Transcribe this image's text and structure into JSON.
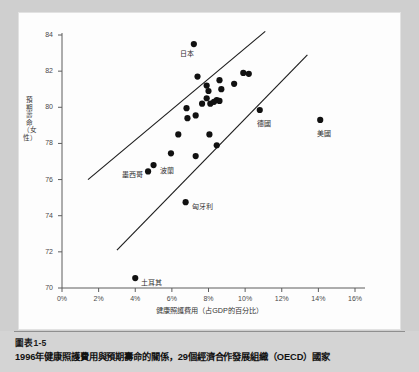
{
  "figure": {
    "caption_number": "圖表1-5",
    "caption_title": "1996年健康照護費用與預期壽命的關係，29個經濟合作發展組織（OECD）國家"
  },
  "chart_data": {
    "type": "scatter",
    "title": "",
    "xlabel": "健康照護費用（占GDP的百分比）",
    "ylabel": "預期壽命（女性）",
    "xlim": [
      0,
      16
    ],
    "ylim": [
      70,
      84
    ],
    "grid": false,
    "legend": "none",
    "xticks": [
      "0%",
      "2%",
      "4%",
      "6%",
      "8%",
      "10%",
      "12%",
      "14%",
      "16%"
    ],
    "xtick_values": [
      0,
      2,
      4,
      6,
      8,
      10,
      12,
      14,
      16
    ],
    "yticks": [
      "70",
      "72",
      "74",
      "76",
      "78",
      "80",
      "82",
      "84"
    ],
    "ytick_values": [
      70,
      72,
      74,
      76,
      78,
      80,
      82,
      84
    ],
    "marker": {
      "shape": "circle",
      "color": "#111111",
      "size": 3.1
    },
    "points": [
      {
        "x": 7.2,
        "y": 83.5,
        "label": "日本",
        "label_dx": -14,
        "label_dy": 8
      },
      {
        "x": 7.4,
        "y": 81.7,
        "label": ""
      },
      {
        "x": 7.9,
        "y": 81.2,
        "label": ""
      },
      {
        "x": 8.0,
        "y": 80.9,
        "label": ""
      },
      {
        "x": 8.6,
        "y": 81.5,
        "label": ""
      },
      {
        "x": 9.4,
        "y": 81.3,
        "label": ""
      },
      {
        "x": 9.9,
        "y": 81.9,
        "label": ""
      },
      {
        "x": 10.2,
        "y": 81.85,
        "label": ""
      },
      {
        "x": 8.7,
        "y": 81.0,
        "label": ""
      },
      {
        "x": 7.9,
        "y": 80.5,
        "label": ""
      },
      {
        "x": 8.1,
        "y": 80.2,
        "label": ""
      },
      {
        "x": 8.45,
        "y": 80.4,
        "label": ""
      },
      {
        "x": 8.6,
        "y": 80.35,
        "label": ""
      },
      {
        "x": 7.65,
        "y": 80.2,
        "label": ""
      },
      {
        "x": 6.8,
        "y": 79.95,
        "label": ""
      },
      {
        "x": 6.85,
        "y": 79.4,
        "label": ""
      },
      {
        "x": 7.3,
        "y": 79.55,
        "label": ""
      },
      {
        "x": 10.8,
        "y": 79.85,
        "label": "德國",
        "label_dx": -3,
        "label_dy": 12
      },
      {
        "x": 14.1,
        "y": 79.3,
        "label": "美國",
        "label_dx": -3,
        "label_dy": 12
      },
      {
        "x": 6.35,
        "y": 78.5,
        "label": ""
      },
      {
        "x": 8.05,
        "y": 78.5,
        "label": ""
      },
      {
        "x": 8.45,
        "y": 77.9,
        "label": ""
      },
      {
        "x": 5.95,
        "y": 77.45,
        "label": ""
      },
      {
        "x": 7.3,
        "y": 77.3,
        "label": ""
      },
      {
        "x": 5.0,
        "y": 76.8,
        "label": "波蘭",
        "label_dx": 6,
        "label_dy": 4
      },
      {
        "x": 4.7,
        "y": 76.45,
        "label": "墨西哥",
        "label_dx": -26,
        "label_dy": 2
      },
      {
        "x": 6.75,
        "y": 74.75,
        "label": "匈牙利",
        "label_dx": 6,
        "label_dy": 3
      },
      {
        "x": 4.0,
        "y": 70.55,
        "label": "土耳其",
        "label_dx": 6,
        "label_dy": 3
      },
      {
        "x": 8.3,
        "y": 80.3,
        "label": ""
      }
    ],
    "trend_lines": [
      {
        "name": "upper-band-line",
        "x1": 1.42,
        "y1": 76.0,
        "x2": 11.1,
        "y2": 84.2
      },
      {
        "name": "lower-band-line",
        "x1": 3.0,
        "y1": 72.1,
        "x2": 13.4,
        "y2": 82.9
      }
    ]
  }
}
